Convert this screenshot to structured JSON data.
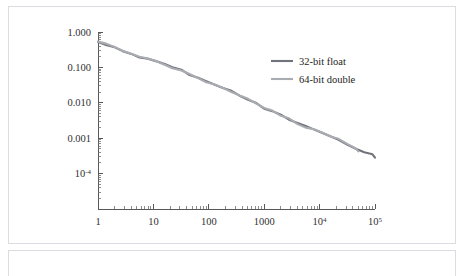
{
  "figure": {
    "name": "convergence-error-figure",
    "background_color": "#ffffff",
    "border_color": "#d9dde2"
  },
  "caption_panel": {
    "text": ""
  },
  "chart_data": {
    "type": "line",
    "title": "",
    "subtitle": "",
    "xlabel": "",
    "ylabel": "",
    "xscale": "log",
    "yscale": "log",
    "xlim": [
      1,
      100000
    ],
    "ylim": [
      1e-05,
      1
    ],
    "grid": false,
    "legend_position": "upper-right",
    "x_tick_labels": [
      "1",
      "10",
      "100",
      "1000",
      "10",
      "10"
    ],
    "x_tick_values": [
      1,
      10,
      100,
      1000,
      10000,
      100000
    ],
    "x_tick_exponents": [
      "",
      "",
      "",
      "",
      "4",
      "5"
    ],
    "y_tick_labels": [
      "1.000",
      "0.100",
      "0.010",
      "0.001",
      "10"
    ],
    "y_tick_values": [
      1,
      0.1,
      0.01,
      0.001,
      0.0001
    ],
    "y_tick_exponents": [
      "",
      "",
      "",
      "",
      "-4"
    ],
    "series": [
      {
        "name": "32-bit float",
        "color": "#70737a",
        "x": [
          1,
          1.4,
          2,
          2.8,
          4,
          5.6,
          8,
          11,
          16,
          22,
          32,
          45,
          64,
          90,
          128,
          180,
          256,
          360,
          512,
          720,
          1000,
          1400,
          2000,
          2800,
          4000,
          5600,
          8000,
          11000,
          16000,
          22000,
          32000,
          45000,
          64000,
          90000,
          100000
        ],
        "y": [
          0.55,
          0.45,
          0.38,
          0.3,
          0.25,
          0.2,
          0.17,
          0.145,
          0.12,
          0.098,
          0.082,
          0.062,
          0.05,
          0.04,
          0.033,
          0.027,
          0.021,
          0.016,
          0.0125,
          0.0098,
          0.0072,
          0.0057,
          0.0044,
          0.0035,
          0.0026,
          0.0021,
          0.0017,
          0.0014,
          0.0011,
          0.00092,
          0.00068,
          0.00052,
          0.00041,
          0.00034,
          0.00029
        ]
      },
      {
        "name": "64-bit double",
        "color": "#a9acb1",
        "x": [
          1,
          1.4,
          2,
          2.8,
          4,
          5.6,
          8,
          11,
          16,
          22,
          32,
          45,
          64,
          90,
          128,
          180,
          256,
          360,
          512,
          720,
          1000,
          1400,
          2000,
          2800,
          4000,
          5600,
          8000,
          11000,
          16000,
          22000,
          32000,
          45000,
          50000
        ],
        "y": [
          0.55,
          0.45,
          0.38,
          0.3,
          0.25,
          0.2,
          0.17,
          0.145,
          0.12,
          0.098,
          0.082,
          0.062,
          0.05,
          0.04,
          0.033,
          0.027,
          0.021,
          0.016,
          0.0125,
          0.0098,
          0.0072,
          0.0057,
          0.0044,
          0.0035,
          0.0026,
          0.0021,
          0.0017,
          0.0014,
          0.0011,
          0.00092,
          0.00068,
          0.00052,
          0.00041
        ]
      }
    ],
    "legend": [
      {
        "label": "32-bit float",
        "color": "#70737a"
      },
      {
        "label": "64-bit double",
        "color": "#a9acb1"
      }
    ]
  }
}
